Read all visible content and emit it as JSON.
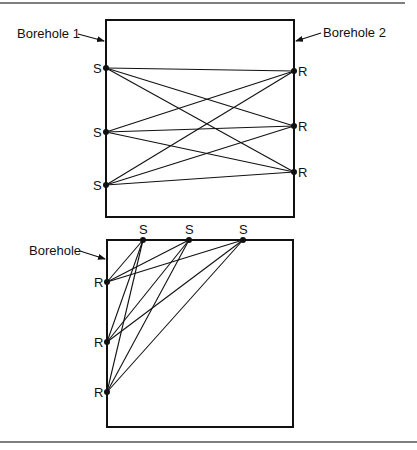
{
  "top_diagram": {
    "borehole_left_label": "Borehole 1",
    "borehole_right_label": "Borehole 2",
    "source_label": "S",
    "receiver_label": "R",
    "sources": [
      {
        "label": "S",
        "x": 106,
        "y": 68
      },
      {
        "label": "S",
        "x": 106,
        "y": 132
      },
      {
        "label": "S",
        "x": 106,
        "y": 185
      }
    ],
    "receivers": [
      {
        "label": "R",
        "x": 294,
        "y": 71
      },
      {
        "label": "R",
        "x": 294,
        "y": 126
      },
      {
        "label": "R",
        "x": 294,
        "y": 172
      }
    ]
  },
  "bottom_diagram": {
    "borehole_label": "Borehole",
    "source_label": "S",
    "receiver_label": "R",
    "sources": [
      {
        "label": "S",
        "x": 143,
        "y": 240
      },
      {
        "label": "S",
        "x": 189,
        "y": 240
      },
      {
        "label": "S",
        "x": 243,
        "y": 240
      }
    ],
    "receivers": [
      {
        "label": "R",
        "x": 107,
        "y": 282
      },
      {
        "label": "R",
        "x": 107,
        "y": 342
      },
      {
        "label": "R",
        "x": 107,
        "y": 392
      }
    ]
  },
  "colors": {
    "ink": "#111111",
    "rule": "#555555",
    "background": "#ffffff"
  }
}
